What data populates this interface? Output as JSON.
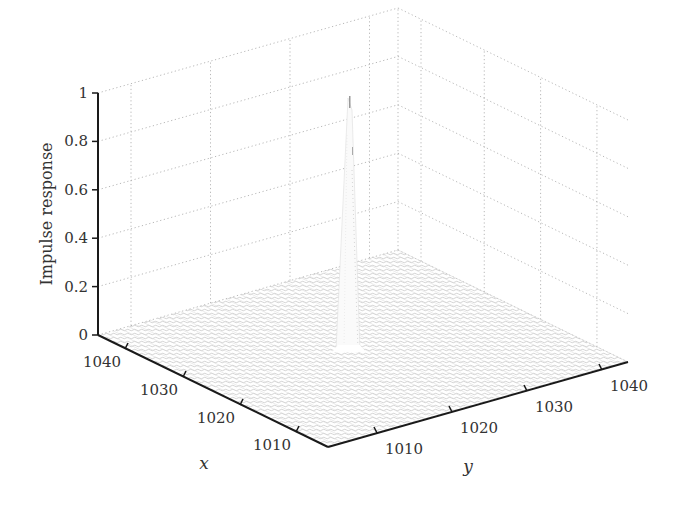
{
  "chart_data": {
    "type": "surface3d",
    "title": "",
    "zlabel": "Impulse response",
    "xlabel": "x",
    "ylabel": "y",
    "zlim": [
      0,
      1
    ],
    "z_ticks": [
      "0",
      "0.2",
      "0.4",
      "0.6",
      "0.8",
      "1"
    ],
    "x_ticks": [
      "1010",
      "1020",
      "1030",
      "1040"
    ],
    "y_ticks": [
      "1010",
      "1020",
      "1030",
      "1040"
    ],
    "xlim": [
      1005,
      1044
    ],
    "ylim": [
      1006,
      1044
    ],
    "grid": true,
    "peak": {
      "x": 1024,
      "y": 1024,
      "z": 1.0
    }
  },
  "colors": {
    "axis": "#1a1a1a",
    "grid": "#b0b0b0",
    "mesh": "#c8c8c8",
    "peak": "#e8e8e8",
    "text": "#333333"
  }
}
